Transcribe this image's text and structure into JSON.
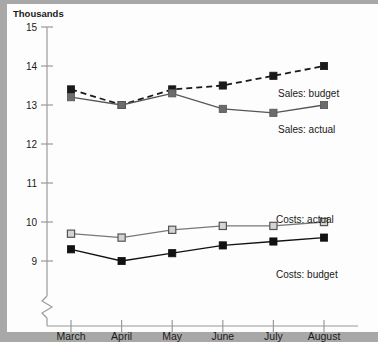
{
  "chart_data": {
    "type": "line",
    "title": "",
    "subtitle": "",
    "ylabel": "Thousands",
    "xlabel": "",
    "categories": [
      "March",
      "April",
      "May",
      "June",
      "July",
      "August"
    ],
    "ylim": [
      9,
      15
    ],
    "yticks": [
      9,
      10,
      11,
      12,
      13,
      14,
      15
    ],
    "ytick_labels": [
      "9",
      "10",
      "11",
      "12",
      "13",
      "14",
      "15"
    ],
    "axis_break": true,
    "grid": false,
    "legend_position": "inline-annotations",
    "series": [
      {
        "name": "Sales: budget",
        "values": [
          13.4,
          13.0,
          13.4,
          13.5,
          13.75,
          14.0
        ],
        "line_style": "dashed",
        "marker": "filled-square",
        "color": "#1a1a1a",
        "marker_fill": "#1a1a1a"
      },
      {
        "name": "Sales: actual",
        "values": [
          13.2,
          13.0,
          13.3,
          12.9,
          12.8,
          13.0
        ],
        "line_style": "solid",
        "marker": "filled-square",
        "color": "#555555",
        "marker_fill": "#6b6b6b"
      },
      {
        "name": "Costs: actual",
        "values": [
          9.7,
          9.6,
          9.8,
          9.9,
          9.9,
          10.0
        ],
        "line_style": "solid",
        "marker": "open-square",
        "color": "#777777",
        "marker_fill": "#d4d4d4"
      },
      {
        "name": "Costs: budget",
        "values": [
          9.3,
          9.0,
          9.2,
          9.4,
          9.5,
          9.6
        ],
        "line_style": "solid",
        "marker": "filled-square",
        "color": "#111111",
        "marker_fill": "#111111"
      }
    ],
    "annotations": [
      {
        "text": "Sales: budget",
        "series": "Sales: budget",
        "x": 278,
        "y": 97
      },
      {
        "text": "Sales: actual",
        "series": "Sales: actual",
        "x": 278,
        "y": 133
      },
      {
        "text": "Costs: actual",
        "series": "Costs: actual",
        "x": 276,
        "y": 223
      },
      {
        "text": "Costs: budget",
        "series": "Costs: budget",
        "x": 276,
        "y": 278
      }
    ]
  },
  "axis": {
    "y_title": "Thousands",
    "y_ticks": [
      "15",
      "14",
      "13",
      "12",
      "11",
      "10",
      "9"
    ],
    "x_ticks": [
      "March",
      "April",
      "May",
      "June",
      "July",
      "August"
    ]
  },
  "labels": {
    "sales_budget": "Sales: budget",
    "sales_actual": "Sales: actual",
    "costs_actual": "Costs: actual",
    "costs_budget": "Costs: budget"
  },
  "colors": {
    "page_border": "#a8a8a8",
    "paper": "#fdfdfd",
    "axis": "#9a9a9a",
    "sales_budget": "#1a1a1a",
    "sales_actual": "#6b6b6b",
    "costs_actual": "#d4d4d4",
    "costs_budget": "#111111"
  }
}
